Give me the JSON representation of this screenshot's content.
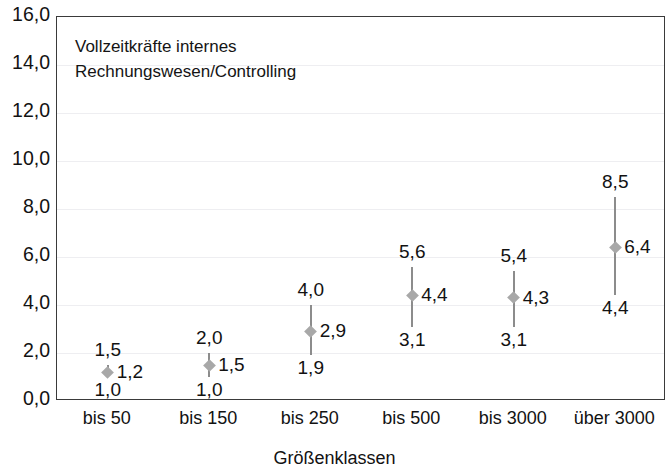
{
  "chart_data": {
    "type": "scatter",
    "title": "",
    "annotation_lines": [
      "Vollzeitkräfte internes",
      "Rechnungswesen/Controlling"
    ],
    "xlabel": "Größenklassen",
    "ylabel": "",
    "ylim": [
      0.0,
      16.0
    ],
    "ytick_step": 2.0,
    "ytick_labels": [
      "0,0",
      "2,0",
      "4,0",
      "6,0",
      "8,0",
      "10,0",
      "12,0",
      "14,0",
      "16,0"
    ],
    "ytick_values": [
      0.0,
      2.0,
      4.0,
      6.0,
      8.0,
      10.0,
      12.0,
      14.0,
      16.0
    ],
    "grid": true,
    "legend": "none",
    "categories": [
      "bis 50",
      "bis 150",
      "bis 250",
      "bis 500",
      "bis 3000",
      "über 3000"
    ],
    "series": [
      {
        "name": "Minimum",
        "values": [
          1.0,
          1.0,
          1.9,
          3.1,
          3.1,
          4.4
        ]
      },
      {
        "name": "Mittelwert",
        "values": [
          1.2,
          1.5,
          2.9,
          4.4,
          4.3,
          6.4
        ]
      },
      {
        "name": "Maximum",
        "values": [
          1.5,
          2.0,
          4.0,
          5.6,
          5.4,
          8.5
        ]
      }
    ],
    "points": [
      {
        "category": "bis 50",
        "min": 1.0,
        "mean": 1.2,
        "max": 1.5,
        "min_label": "1,0",
        "mean_label": "1,2",
        "max_label": "1,5"
      },
      {
        "category": "bis 150",
        "min": 1.0,
        "mean": 1.5,
        "max": 2.0,
        "min_label": "1,0",
        "mean_label": "1,5",
        "max_label": "2,0"
      },
      {
        "category": "bis 250",
        "min": 1.9,
        "mean": 2.9,
        "max": 4.0,
        "min_label": "1,9",
        "mean_label": "2,9",
        "max_label": "4,0"
      },
      {
        "category": "bis 500",
        "min": 3.1,
        "mean": 4.4,
        "max": 5.6,
        "min_label": "3,1",
        "mean_label": "4,4",
        "max_label": "5,6"
      },
      {
        "category": "bis 3000",
        "min": 3.1,
        "mean": 4.3,
        "max": 5.4,
        "min_label": "3,1",
        "mean_label": "4,3",
        "max_label": "5,4"
      },
      {
        "category": "über 3000",
        "min": 4.4,
        "mean": 6.4,
        "max": 8.5,
        "min_label": "4,4",
        "mean_label": "6,4",
        "max_label": "8,5"
      }
    ],
    "colors": {
      "error_line": "#8c8c8c",
      "marker": "#a8a8a8",
      "gridline": "#eeeef1",
      "frame": "#3a3a3a",
      "text": "#121212",
      "background": "#ffffff"
    }
  }
}
